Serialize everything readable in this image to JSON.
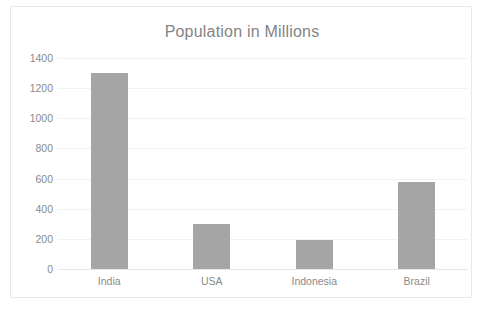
{
  "chart_data": {
    "type": "bar",
    "title": "Population in Millions",
    "xlabel": "",
    "ylabel": "",
    "categories": [
      "India",
      "USA",
      "Indonesia",
      "Brazil"
    ],
    "values": [
      1300,
      300,
      190,
      580
    ],
    "ylim": [
      0,
      1400
    ],
    "ytick_labels": [
      "1400",
      "1200",
      "1000",
      "800",
      "600",
      "400",
      "200",
      "0"
    ],
    "ytick_values": [
      1400,
      1200,
      1000,
      800,
      600,
      400,
      200,
      0
    ],
    "ytick_step": 200,
    "grid": true,
    "legend": false,
    "legend_position": "none",
    "series": [
      {
        "name": "Population in Millions",
        "values": [
          1300,
          300,
          190,
          580
        ],
        "color": "#a5a5a5"
      }
    ],
    "colors": {
      "bar": "#a5a5a5",
      "gridline": "#f2f2f2",
      "axis": "#e6e6e6",
      "title_text": "#848484",
      "tick_text": "#8a8a8a",
      "plot_border": "#e9e9e9",
      "background": "#ffffff"
    }
  }
}
